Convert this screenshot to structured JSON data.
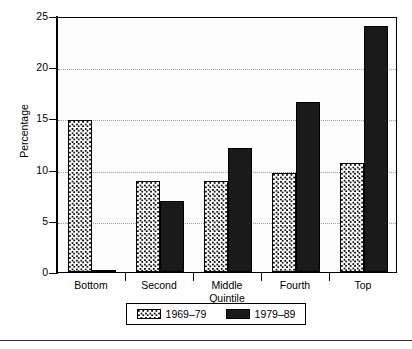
{
  "chart_data": {
    "type": "bar",
    "title": "",
    "xlabel": "Quintile",
    "ylabel": "Percentage",
    "categories": [
      "Bottom",
      "Second",
      "Middle",
      "Fourth",
      "Top"
    ],
    "series": [
      {
        "name": "1969–79",
        "values": [
          14.8,
          8.9,
          8.9,
          9.7,
          10.6
        ],
        "fill": "checkered-pattern",
        "color": "#ffffff"
      },
      {
        "name": "1979–89",
        "values": [
          0.2,
          6.9,
          12.1,
          16.6,
          24.0
        ],
        "fill": "solid",
        "color": "#1a1a1a"
      }
    ],
    "ylim": [
      0,
      25
    ],
    "yticks": [
      0,
      5,
      10,
      15,
      20,
      25
    ],
    "ytick_labels": [
      "0",
      "5",
      "10",
      "15",
      "20",
      "25"
    ],
    "gridlines": [
      5,
      10,
      15,
      20
    ],
    "grid": true,
    "grid_style": "dotted",
    "legend_position": "bottom-center"
  },
  "axis": {
    "y_title": "Percentage",
    "x_title": "Quintile",
    "y_labels": [
      "25",
      "20",
      "15",
      "10",
      "5",
      "0"
    ],
    "x_labels": [
      "Bottom",
      "Second",
      "Middle",
      "Fourth",
      "Top"
    ]
  },
  "legend": {
    "entries": [
      {
        "label": "1969–79"
      },
      {
        "label": "1979–89"
      }
    ]
  }
}
